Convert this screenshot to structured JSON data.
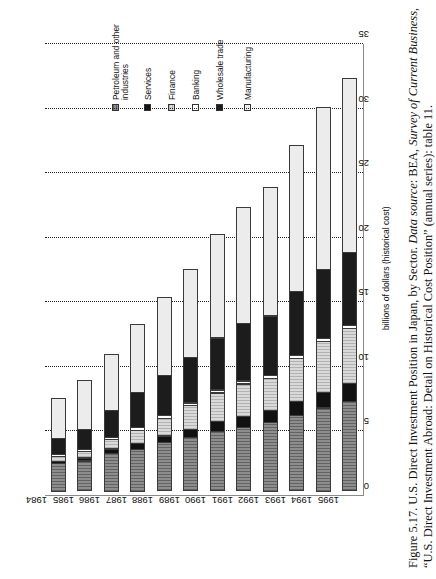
{
  "figure": {
    "caption_line1_a": "Figure 5.17. U.S. Direct Investment Position in Japan, by Sector. ",
    "caption_line1_b": "Data source",
    "caption_line1_c": ": BEA, ",
    "caption_line1_d": "Survey of Current Business",
    "caption_line1_e": ",",
    "caption_line2": "“U.S. Direct Investment Abroad: Detail on Historical Cost Position” (annual series): table 11."
  },
  "chart_data": {
    "type": "bar",
    "orientation": "horizontal-rotated",
    "title": "U.S. Direct Investment Position in Japan, by Sector",
    "xlabel": "",
    "ylabel": "billions of dollars (historical cost)",
    "value_axis_label": "billions of dollars (historical cost)",
    "ylim": [
      0,
      35
    ],
    "ticks": [
      0,
      5,
      10,
      15,
      20,
      25,
      30,
      35
    ],
    "tick_labels": [
      "0",
      "5",
      "10",
      "15",
      "20",
      "25",
      "30",
      "35"
    ],
    "grid": true,
    "grid_style": "dotted",
    "legend_position": "top-center",
    "stacked": true,
    "categories": [
      "1984",
      "1985",
      "1986",
      "1987",
      "1988",
      "1989",
      "1990",
      "1991",
      "1992",
      "1993",
      "1994",
      "1995"
    ],
    "series": [
      {
        "name": "Manufacturing",
        "swatch": "#ececec",
        "values": [
          3.2,
          3.9,
          4.4,
          5.3,
          6.1,
          6.9,
          8.1,
          9.1,
          10.0,
          11.4,
          12.6,
          13.6
        ]
      },
      {
        "name": "Wholesale trade",
        "swatch": "#1c1c1c",
        "values": [
          1.3,
          1.6,
          2.2,
          2.8,
          3.2,
          3.6,
          4.1,
          4.5,
          4.7,
          5.0,
          5.4,
          5.7
        ]
      },
      {
        "name": "Banking",
        "swatch": "#ffffff",
        "values": [
          0.2,
          0.2,
          0.2,
          0.3,
          0.3,
          0.3,
          0.3,
          0.3,
          0.3,
          0.3,
          0.3,
          0.3
        ]
      },
      {
        "name": "Finance",
        "swatch": "#d9d9d9",
        "values": [
          0.5,
          0.6,
          0.8,
          1.1,
          1.4,
          1.9,
          2.3,
          2.6,
          2.5,
          3.4,
          4.0,
          4.3
        ]
      },
      {
        "name": "Services",
        "swatch": "#111111",
        "values": [
          0.2,
          0.3,
          0.4,
          0.5,
          0.6,
          0.7,
          0.8,
          0.9,
          1.0,
          1.2,
          1.3,
          1.5
        ]
      },
      {
        "name": "Petroleum and other industries",
        "swatch": "#8d8d8d",
        "values": [
          2.2,
          2.4,
          3.0,
          3.3,
          3.8,
          4.2,
          4.7,
          5.0,
          5.4,
          5.9,
          6.5,
          7.0
        ]
      }
    ],
    "totals": [
      7.6,
      9.0,
      11.0,
      13.3,
      15.4,
      17.6,
      20.3,
      22.4,
      23.9,
      27.2,
      30.1,
      32.4
    ]
  },
  "legend": {
    "items": [
      {
        "label_line1": "Petroleum and other",
        "label_line2": "industries",
        "swatch": "#8d8d8d"
      },
      {
        "label_line1": "Services",
        "label_line2": "",
        "swatch": "#111111"
      },
      {
        "label_line1": "Finance",
        "label_line2": "",
        "swatch": "#d9d9d9"
      },
      {
        "label_line1": "Banking",
        "label_line2": "",
        "swatch": "#ffffff"
      },
      {
        "label_line1": "Wholesale trade",
        "label_line2": "",
        "swatch": "#1c1c1c"
      },
      {
        "label_line1": "Manufacturing",
        "label_line2": "",
        "swatch": "#ececec"
      }
    ]
  }
}
